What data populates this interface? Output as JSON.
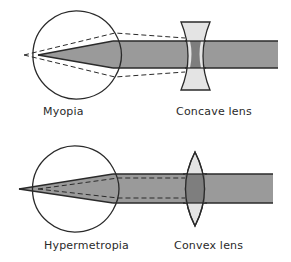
{
  "diagram": {
    "top": {
      "condition_label": "Myopia",
      "lens_label": "Concave lens"
    },
    "bottom": {
      "condition_label": "Hypermetropia",
      "lens_label": "Convex lens"
    }
  },
  "colors": {
    "beam_fill": "#9a9a9a",
    "lens_fill": "#e4e4e4",
    "lens_overlap_fill": "#7e7e7e",
    "stroke": "#2a2a2a",
    "background": "#ffffff"
  }
}
